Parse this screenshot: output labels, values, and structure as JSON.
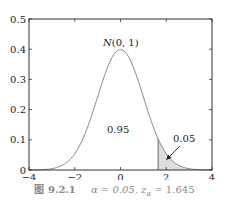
{
  "chart_data": {
    "type": "line",
    "title": "N(0, 1)",
    "xlabel": "",
    "ylabel": "",
    "xlim": [
      -4,
      4
    ],
    "ylim": [
      0,
      0.5
    ],
    "xticks": [
      -4,
      -2,
      0,
      2,
      4
    ],
    "xtick_labels": [
      "−4",
      "−2",
      "0",
      "2",
      "4"
    ],
    "yticks": [
      0,
      0.1,
      0.2,
      0.3,
      0.4,
      0.5
    ],
    "ytick_labels": [
      "0",
      "0.1",
      "0.2",
      "0.3",
      "0.4",
      "0.5"
    ],
    "grid": false,
    "series": [
      {
        "name": "N(0, 1) density",
        "x": [
          -4,
          -3.5,
          -3,
          -2.5,
          -2,
          -1.5,
          -1,
          -0.5,
          0,
          0.5,
          1,
          1.5,
          2,
          2.5,
          3,
          3.5,
          4
        ],
        "values": [
          0.0001,
          0.0009,
          0.0044,
          0.0175,
          0.054,
          0.1295,
          0.242,
          0.3521,
          0.3989,
          0.3521,
          0.242,
          0.1295,
          0.054,
          0.0175,
          0.0044,
          0.0009,
          0.0001
        ]
      }
    ],
    "shaded_region": {
      "from": 1.645,
      "to": 4,
      "area": 0.05
    },
    "annotations": [
      {
        "text": "N(0, 1)",
        "x": 0,
        "y": 0.43
      },
      {
        "text": "0.95",
        "x": 0,
        "y": 0.135
      },
      {
        "text": "0.05",
        "x": 2.6,
        "y": 0.1,
        "arrow_to": [
          2.0,
          0.04
        ]
      }
    ]
  },
  "labels": {
    "curve_label_n": "N",
    "curve_label_rest": "(0, 1)",
    "center_area": "0.95",
    "tail_area": "0.05"
  },
  "caption": {
    "figure_number": "图 9.2.1",
    "text": "α = 0.05, z",
    "sub": "α",
    "tail": " = 1.645"
  }
}
